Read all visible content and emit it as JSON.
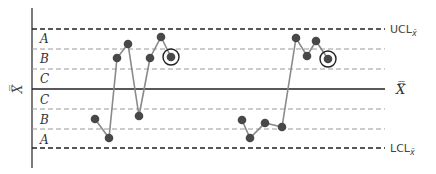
{
  "chart_data": {
    "type": "line",
    "title": "",
    "ylabel": "X̿",
    "xlabel": "",
    "grid": false,
    "limits": {
      "ucl": {
        "label": "UCL",
        "subscript": "x̄",
        "y_px": 29,
        "style": "dashed-heavy"
      },
      "center": {
        "label": "X̿",
        "y_px": 89,
        "style": "solid"
      },
      "lcl": {
        "label": "LCL",
        "subscript": "x̄",
        "y_px": 148,
        "style": "dashed-heavy"
      }
    },
    "zone_boundaries_px": {
      "upper_AB": 49,
      "upper_BC": 69,
      "lower_CB": 109,
      "lower_BA": 129
    },
    "zones_upper": [
      "A",
      "B",
      "C"
    ],
    "zones_lower": [
      "C",
      "B",
      "A"
    ],
    "series": [
      {
        "name": "Run 1",
        "points_px": [
          [
            95,
            119
          ],
          [
            109,
            138
          ],
          [
            117,
            58
          ],
          [
            128,
            44
          ],
          [
            139,
            116
          ],
          [
            150,
            58
          ],
          [
            161,
            37
          ],
          [
            171,
            57
          ]
        ],
        "zones": [
          "lower B",
          "lower A",
          "upper B",
          "upper A",
          "lower B",
          "upper B",
          "upper A",
          "upper B"
        ],
        "circled_index": 7
      },
      {
        "name": "Run 2",
        "points_px": [
          [
            242,
            120
          ],
          [
            250,
            138
          ],
          [
            265,
            123
          ],
          [
            282,
            127
          ],
          [
            296,
            38
          ],
          [
            307,
            56
          ],
          [
            316,
            41
          ],
          [
            328,
            59
          ]
        ],
        "zones": [
          "lower B",
          "lower A",
          "lower B",
          "lower B",
          "upper A",
          "upper B",
          "upper A",
          "upper B"
        ],
        "circled_index": 7
      }
    ],
    "colors": {
      "line": "#8a8a8a",
      "point": "#484848",
      "axis": "#222222",
      "dashed": "#999999"
    }
  },
  "labels": {
    "zones": {
      "upperA": "A",
      "upperB": "B",
      "upperC": "C",
      "lowerC": "C",
      "lowerB": "B",
      "lowerA": "A"
    },
    "ucl": "UCL",
    "ucl_sub": "x̄",
    "lcl": "LCL",
    "lcl_sub": "x̄",
    "center": "X̿",
    "yaxis": "X̿"
  }
}
